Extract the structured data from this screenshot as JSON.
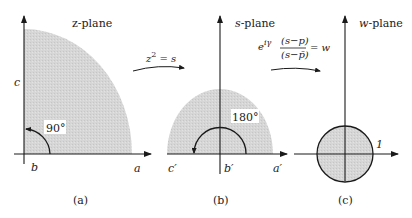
{
  "figure": {
    "colors": {
      "region_fill": "#d4d4d4",
      "stroke": "#1a1a1a",
      "background": "#ffffff"
    },
    "panels": [
      {
        "id": "a",
        "title": "z-plane",
        "caption": "(a)",
        "region": "quarter-disk (first quadrant)",
        "angle_label": "90°",
        "axis_labels": {
          "vertical": "c",
          "origin": "b",
          "horizontal": "a"
        }
      },
      {
        "id": "b",
        "title": "s-plane",
        "title_italic_part": "s",
        "title_rest": "-plane",
        "caption": "(b)",
        "region": "upper half-disk",
        "angle_label": "180°",
        "axis_labels": {
          "left": "c′",
          "origin": "b′",
          "right": "a′"
        }
      },
      {
        "id": "c",
        "title": "w-plane",
        "title_italic_part": "w",
        "title_rest": "-plane",
        "caption": "(c)",
        "region": "unit disk",
        "radius_label": "1"
      }
    ],
    "mappings": [
      {
        "from": "a",
        "to": "b",
        "formula": "z² = s",
        "parts": {
          "base": "z",
          "exp": "2",
          "rest": " = s"
        }
      },
      {
        "from": "b",
        "to": "c",
        "formula": "e^{iγ} (s−p)/(s−p̄) = w",
        "parts": {
          "base": "e",
          "exp": "iγ",
          "numerator": "(s−p)",
          "denominator": "(s−p̄)",
          "rhs": "= w"
        }
      }
    ]
  }
}
